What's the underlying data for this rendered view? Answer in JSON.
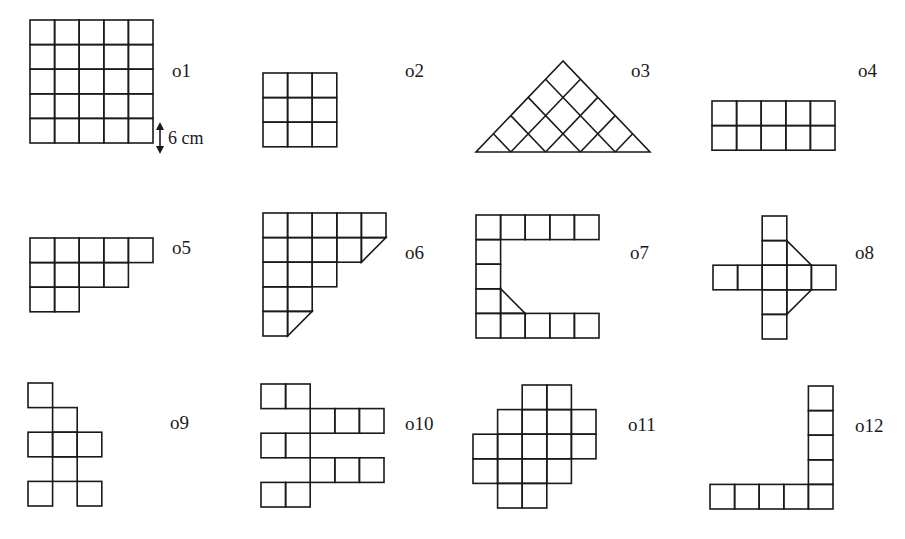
{
  "figure": {
    "cell_size_px": 24.6,
    "scale_annotation": "6 cm",
    "shapes": [
      {
        "id": "o1",
        "label": "o1",
        "origin": [
          30,
          20
        ],
        "label_pos": [
          172,
          77
        ],
        "cells": [
          [
            0,
            0
          ],
          [
            1,
            0
          ],
          [
            2,
            0
          ],
          [
            3,
            0
          ],
          [
            4,
            0
          ],
          [
            0,
            1
          ],
          [
            1,
            1
          ],
          [
            2,
            1
          ],
          [
            3,
            1
          ],
          [
            4,
            1
          ],
          [
            0,
            2
          ],
          [
            1,
            2
          ],
          [
            2,
            2
          ],
          [
            3,
            2
          ],
          [
            4,
            2
          ],
          [
            0,
            3
          ],
          [
            1,
            3
          ],
          [
            2,
            3
          ],
          [
            3,
            3
          ],
          [
            4,
            3
          ],
          [
            0,
            4
          ],
          [
            1,
            4
          ],
          [
            2,
            4
          ],
          [
            3,
            4
          ],
          [
            4,
            4
          ]
        ]
      },
      {
        "id": "o2",
        "label": "o2",
        "origin": [
          263,
          73
        ],
        "label_pos": [
          405,
          77
        ],
        "cells": [
          [
            0,
            0
          ],
          [
            1,
            0
          ],
          [
            2,
            0
          ],
          [
            0,
            1
          ],
          [
            1,
            1
          ],
          [
            2,
            1
          ],
          [
            0,
            2
          ],
          [
            1,
            2
          ],
          [
            2,
            2
          ]
        ]
      },
      {
        "id": "o3",
        "label": "o3",
        "type": "triangle",
        "apex": [
          563,
          61
        ],
        "base": [
          [
            476,
            152
          ],
          [
            650,
            152
          ]
        ],
        "label_pos": [
          631,
          77
        ]
      },
      {
        "id": "o4",
        "label": "o4",
        "origin": [
          712,
          101
        ],
        "label_pos": [
          858,
          77
        ],
        "cells": [
          [
            0,
            0
          ],
          [
            1,
            0
          ],
          [
            2,
            0
          ],
          [
            3,
            0
          ],
          [
            4,
            0
          ],
          [
            0,
            1
          ],
          [
            1,
            1
          ],
          [
            2,
            1
          ],
          [
            3,
            1
          ],
          [
            4,
            1
          ]
        ]
      },
      {
        "id": "o5",
        "label": "o5",
        "origin": [
          30,
          238
        ],
        "label_pos": [
          172,
          254
        ],
        "cells": [
          [
            0,
            0
          ],
          [
            1,
            0
          ],
          [
            2,
            0
          ],
          [
            3,
            0
          ],
          [
            4,
            0
          ],
          [
            0,
            1
          ],
          [
            1,
            1
          ],
          [
            2,
            1
          ],
          [
            3,
            1
          ],
          [
            0,
            2
          ],
          [
            1,
            2
          ]
        ]
      },
      {
        "id": "o6",
        "label": "o6",
        "origin": [
          263,
          213
        ],
        "label_pos": [
          405,
          259
        ],
        "cells": [
          [
            0,
            0
          ],
          [
            1,
            0
          ],
          [
            2,
            0
          ],
          [
            3,
            0
          ],
          [
            4,
            0
          ],
          [
            0,
            1
          ],
          [
            1,
            1
          ],
          [
            2,
            1
          ],
          [
            3,
            1
          ],
          [
            0,
            2
          ],
          [
            1,
            2
          ],
          [
            2,
            2
          ],
          [
            0,
            3
          ],
          [
            1,
            3
          ],
          [
            0,
            4
          ]
        ],
        "triangles": [
          [
            [
              4,
              1
            ],
            [
              5,
              1
            ],
            [
              4,
              2
            ]
          ],
          [
            [
              1,
              4
            ],
            [
              2,
              4
            ],
            [
              1,
              5
            ]
          ]
        ]
      },
      {
        "id": "o7",
        "label": "o7",
        "origin": [
          476,
          215
        ],
        "label_pos": [
          630,
          259
        ],
        "cells": [
          [
            0,
            0
          ],
          [
            1,
            0
          ],
          [
            2,
            0
          ],
          [
            3,
            0
          ],
          [
            4,
            0
          ],
          [
            0,
            1
          ],
          [
            0,
            2
          ],
          [
            0,
            3
          ],
          [
            0,
            4
          ],
          [
            1,
            4
          ],
          [
            2,
            4
          ],
          [
            3,
            4
          ],
          [
            4,
            4
          ]
        ],
        "triangles": [
          [
            [
              1,
              3
            ],
            [
              1,
              4
            ],
            [
              2,
              4
            ]
          ]
        ]
      },
      {
        "id": "o8",
        "label": "o8",
        "origin": [
          713,
          216
        ],
        "label_pos": [
          855,
          259
        ],
        "cells": [
          [
            2,
            0
          ],
          [
            2,
            1
          ],
          [
            0,
            2
          ],
          [
            1,
            2
          ],
          [
            2,
            2
          ],
          [
            3,
            2
          ],
          [
            4,
            2
          ],
          [
            2,
            3
          ],
          [
            2,
            4
          ]
        ],
        "triangles": [
          [
            [
              3,
              1
            ],
            [
              4,
              2
            ],
            [
              3,
              2
            ]
          ],
          [
            [
              3,
              3
            ],
            [
              4,
              3
            ],
            [
              3,
              4
            ]
          ]
        ]
      },
      {
        "id": "o9",
        "label": "o9",
        "origin": [
          28,
          383
        ],
        "label_pos": [
          170,
          429
        ],
        "cells": [
          [
            0,
            0
          ],
          [
            1,
            1
          ],
          [
            0,
            2
          ],
          [
            1,
            2
          ],
          [
            2,
            2
          ],
          [
            1,
            3
          ],
          [
            0,
            4
          ],
          [
            2,
            4
          ]
        ]
      },
      {
        "id": "o10",
        "label": "o10",
        "origin": [
          261,
          384
        ],
        "label_pos": [
          405,
          430
        ],
        "cells": [
          [
            0,
            0
          ],
          [
            1,
            0
          ],
          [
            2,
            1
          ],
          [
            3,
            1
          ],
          [
            4,
            1
          ],
          [
            0,
            2
          ],
          [
            1,
            2
          ],
          [
            2,
            3
          ],
          [
            3,
            3
          ],
          [
            4,
            3
          ],
          [
            0,
            4
          ],
          [
            1,
            4
          ]
        ]
      },
      {
        "id": "o11",
        "label": "o11",
        "origin": [
          473,
          385
        ],
        "label_pos": [
          628,
          431
        ],
        "cells": [
          [
            2,
            0
          ],
          [
            3,
            0
          ],
          [
            1,
            1
          ],
          [
            2,
            1
          ],
          [
            3,
            1
          ],
          [
            4,
            1
          ],
          [
            0,
            2
          ],
          [
            1,
            2
          ],
          [
            2,
            2
          ],
          [
            3,
            2
          ],
          [
            4,
            2
          ],
          [
            0,
            3
          ],
          [
            1,
            3
          ],
          [
            2,
            3
          ],
          [
            3,
            3
          ],
          [
            1,
            4
          ],
          [
            2,
            4
          ]
        ]
      },
      {
        "id": "o12",
        "label": "o12",
        "origin": [
          710,
          386
        ],
        "label_pos": [
          855,
          432
        ],
        "cells": [
          [
            4,
            0
          ],
          [
            4,
            1
          ],
          [
            4,
            2
          ],
          [
            4,
            3
          ],
          [
            0,
            4
          ],
          [
            1,
            4
          ],
          [
            2,
            4
          ],
          [
            3,
            4
          ],
          [
            4,
            4
          ]
        ]
      }
    ]
  }
}
